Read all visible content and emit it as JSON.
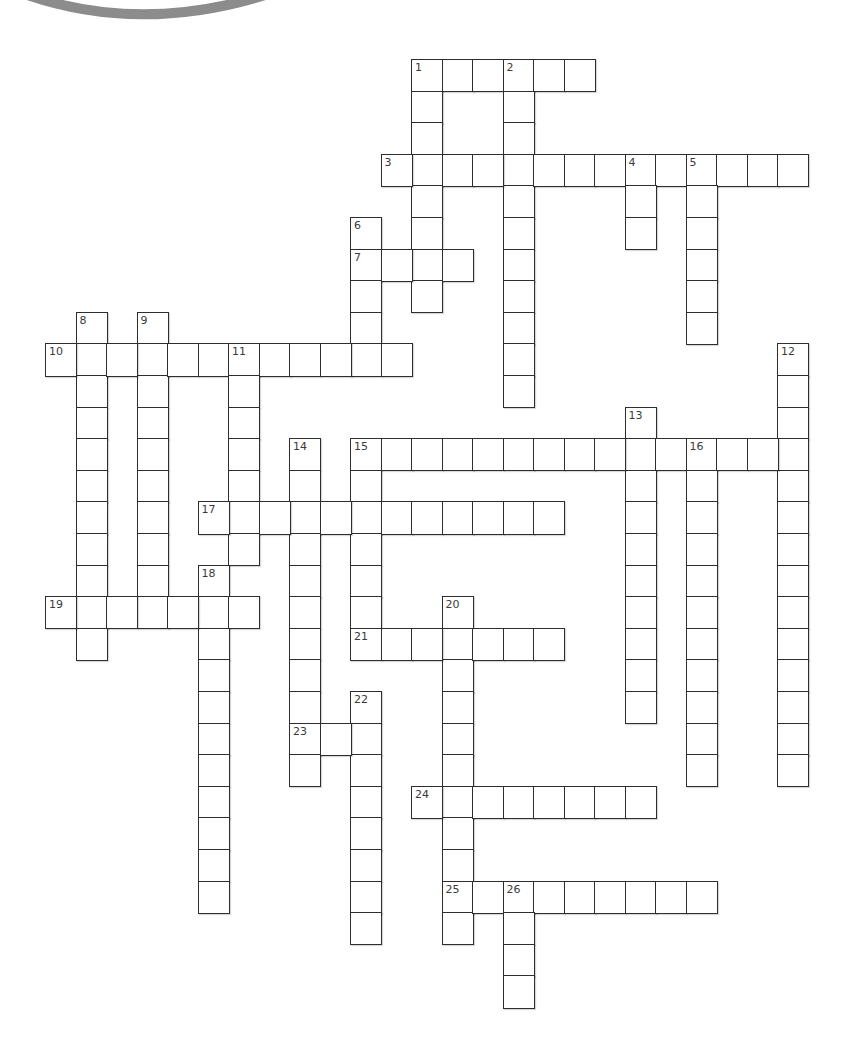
{
  "puzzle": {
    "type": "crossword",
    "decoration": {
      "shape": "arc",
      "color": "#8c8c8c"
    },
    "grid": {
      "origin_x": 46,
      "origin_y": 60,
      "cell_w": 30.5,
      "cell_h": 31.6,
      "border_color": "#2e2e2e",
      "number_color": "#3a3a3a"
    },
    "entries": [
      {
        "number": 1,
        "direction": "across",
        "row": 0,
        "col": 12,
        "length": 6
      },
      {
        "number": 1,
        "direction": "down",
        "row": 0,
        "col": 12,
        "length": 8
      },
      {
        "number": 2,
        "direction": "down",
        "row": 0,
        "col": 15,
        "length": 11
      },
      {
        "number": 3,
        "direction": "across",
        "row": 3,
        "col": 11,
        "length": 14
      },
      {
        "number": 4,
        "direction": "down",
        "row": 3,
        "col": 19,
        "length": 3
      },
      {
        "number": 5,
        "direction": "down",
        "row": 3,
        "col": 21,
        "length": 6
      },
      {
        "number": 6,
        "direction": "down",
        "row": 5,
        "col": 10,
        "length": 5
      },
      {
        "number": 7,
        "direction": "across",
        "row": 6,
        "col": 10,
        "length": 4
      },
      {
        "number": 8,
        "direction": "down",
        "row": 8,
        "col": 1,
        "length": 11
      },
      {
        "number": 9,
        "direction": "down",
        "row": 8,
        "col": 3,
        "length": 10
      },
      {
        "number": 10,
        "direction": "across",
        "row": 9,
        "col": 0,
        "length": 12
      },
      {
        "number": 11,
        "direction": "down",
        "row": 9,
        "col": 6,
        "length": 7
      },
      {
        "number": 12,
        "direction": "down",
        "row": 9,
        "col": 24,
        "length": 14
      },
      {
        "number": 13,
        "direction": "down",
        "row": 11,
        "col": 19,
        "length": 10
      },
      {
        "number": 14,
        "direction": "down",
        "row": 12,
        "col": 8,
        "length": 11
      },
      {
        "number": 15,
        "direction": "across",
        "row": 12,
        "col": 10,
        "length": 15
      },
      {
        "number": 15,
        "direction": "down",
        "row": 12,
        "col": 10,
        "length": 7
      },
      {
        "number": 16,
        "direction": "down",
        "row": 12,
        "col": 21,
        "length": 11
      },
      {
        "number": 17,
        "direction": "across",
        "row": 14,
        "col": 5,
        "length": 12
      },
      {
        "number": 18,
        "direction": "down",
        "row": 16,
        "col": 5,
        "length": 11
      },
      {
        "number": 19,
        "direction": "across",
        "row": 17,
        "col": 0,
        "length": 7
      },
      {
        "number": 20,
        "direction": "down",
        "row": 17,
        "col": 13,
        "length": 11
      },
      {
        "number": 21,
        "direction": "across",
        "row": 18,
        "col": 10,
        "length": 7
      },
      {
        "number": 22,
        "direction": "down",
        "row": 20,
        "col": 10,
        "length": 8
      },
      {
        "number": 23,
        "direction": "across",
        "row": 21,
        "col": 8,
        "length": 3
      },
      {
        "number": 24,
        "direction": "across",
        "row": 23,
        "col": 12,
        "length": 8
      },
      {
        "number": 25,
        "direction": "across",
        "row": 26,
        "col": 13,
        "length": 9
      },
      {
        "number": 26,
        "direction": "down",
        "row": 26,
        "col": 15,
        "length": 4
      }
    ]
  }
}
